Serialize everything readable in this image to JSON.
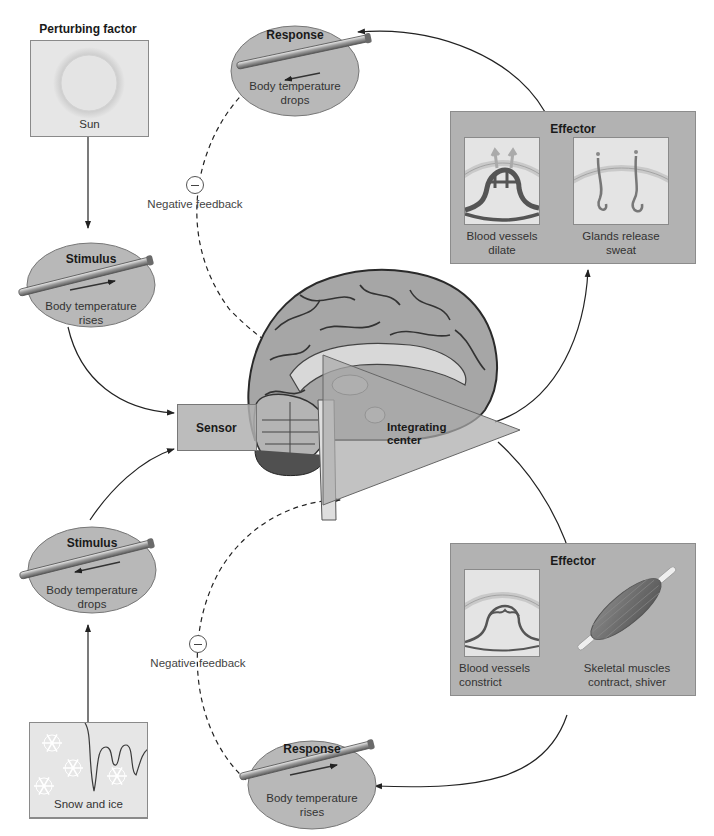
{
  "diagram": {
    "type": "homeostasis-negative-feedback-loop"
  },
  "top_loop": {
    "perturbing_factor": {
      "title": "Perturbing factor",
      "caption": "Sun",
      "icon": "sun-icon"
    },
    "stimulus": {
      "title": "Stimulus",
      "caption_line1": "Body temperature",
      "caption_line2": "rises",
      "icon": "thermometer-icon",
      "arrow": "right"
    },
    "response": {
      "title": "Response",
      "caption_line1": "Body temperature",
      "caption_line2": "drops",
      "icon": "thermometer-icon",
      "arrow": "left"
    },
    "effector": {
      "title": "Effector",
      "panels": [
        {
          "caption_line1": "Blood vessels",
          "caption_line2": "dilate",
          "icon": "dilated-blood-vessels-icon"
        },
        {
          "caption_line1": "Glands release",
          "caption_line2": "sweat",
          "icon": "sweat-glands-icon"
        }
      ]
    },
    "feedback": {
      "symbol": "−",
      "label": "Negative feedback"
    }
  },
  "bottom_loop": {
    "perturbing_factor": {
      "title": "Perturbing factor",
      "caption": "Snow and ice",
      "icon": "snowflake-icon"
    },
    "stimulus": {
      "title": "Stimulus",
      "caption_line1": "Body temperature",
      "caption_line2": "drops",
      "icon": "thermometer-icon",
      "arrow": "left"
    },
    "response": {
      "title": "Response",
      "caption_line1": "Body temperature",
      "caption_line2": "rises",
      "icon": "thermometer-icon",
      "arrow": "right"
    },
    "effector": {
      "title": "Effector",
      "panels": [
        {
          "caption_line1": "Blood vessels",
          "caption_line2": "constrict",
          "icon": "constricted-blood-vessels-icon"
        },
        {
          "caption_line1": "Skeletal muscles",
          "caption_line2": "contract, shiver",
          "icon": "skeletal-muscle-icon"
        }
      ]
    },
    "feedback": {
      "symbol": "−",
      "label": "Negative feedback"
    }
  },
  "center": {
    "sensor_label": "Sensor",
    "integrating_center_line1": "Integrating",
    "integrating_center_line2": "center",
    "image": "brain-sagittal-section"
  },
  "colors": {
    "ellipse_fill": "#b8b8b8",
    "effector_fill": "#b2b2b2",
    "panel_fill": "#e4e4e4",
    "arrow": "#222222",
    "brain": "#9a9a9a"
  }
}
